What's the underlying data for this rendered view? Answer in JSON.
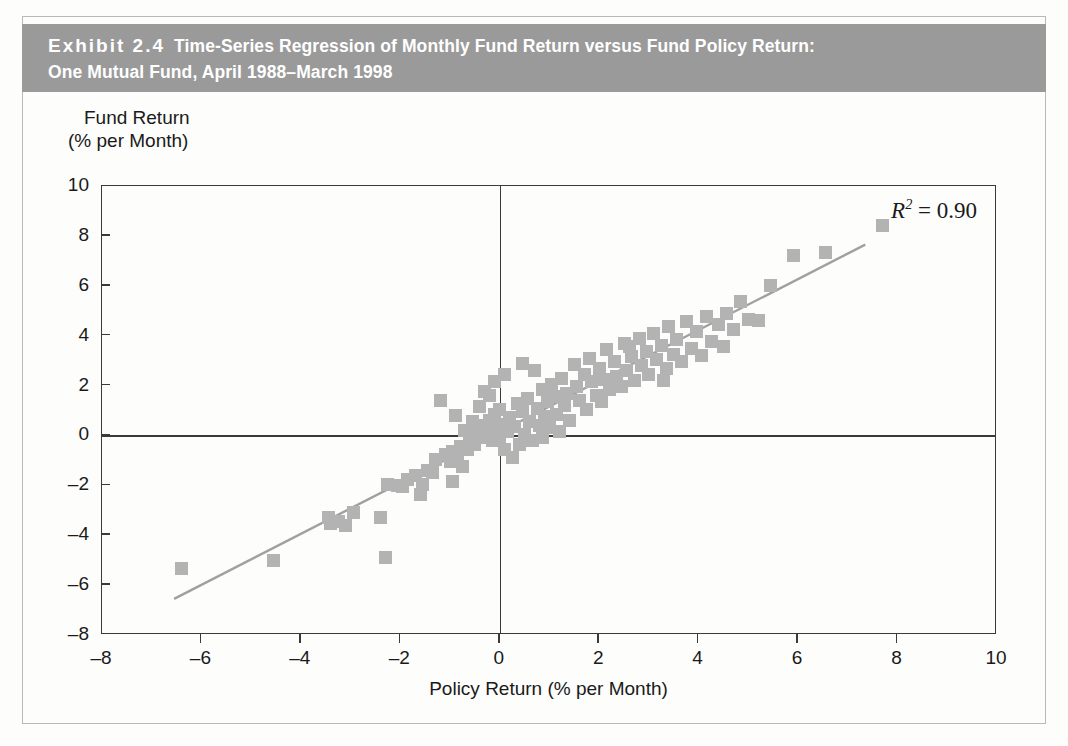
{
  "exhibit": {
    "label": "Exhibit 2.4",
    "title_line_1": "Time-Series Regression of Monthly Fund Return versus Fund Policy Return:",
    "title_line_2": "One Mutual Fund, April 1988–March 1998",
    "banner_color": "#9a9a9a",
    "banner_text_color": "#ffffff"
  },
  "chart_data": {
    "type": "scatter",
    "title": "Time-Series Regression of Monthly Fund Return versus Fund Policy Return: One Mutual Fund, April 1988–March 1998",
    "xlabel": "Policy Return (% per Month)",
    "ylabel_line_1": "Fund Return",
    "ylabel_line_2": "(% per Month)",
    "ylabel": "Fund Return (% per Month)",
    "xlim": [
      -8,
      10
    ],
    "ylim": [
      -8,
      10
    ],
    "xticks": [
      -8,
      -6,
      -4,
      -2,
      0,
      2,
      4,
      6,
      8,
      10
    ],
    "yticks": [
      -8,
      -6,
      -4,
      -2,
      0,
      2,
      4,
      6,
      8,
      10
    ],
    "xticklabels": [
      "–8",
      "–6",
      "–4",
      "–2",
      "0",
      "2",
      "4",
      "6",
      "8",
      "10"
    ],
    "yticklabels": [
      "–8",
      "–6",
      "–4",
      "–2",
      "0",
      "2",
      "4",
      "6",
      "8",
      "10"
    ],
    "grid": false,
    "legend": false,
    "marker_color": "#b3b3b3",
    "marker_shape": "square",
    "annotation": {
      "text": "R2 = 0.90",
      "r_squared": 0.9,
      "position": "top-right"
    },
    "zero_lines": {
      "x": 0,
      "y": 0
    },
    "regression_line": {
      "x_start": -6.55,
      "y_start": -6.55,
      "x_end": 7.35,
      "y_end": 7.65,
      "color": "#a0a0a0",
      "slope": 1.02,
      "intercept": 0.13
    },
    "points": [
      [
        -6.4,
        -5.35
      ],
      [
        -4.55,
        -5.0
      ],
      [
        -3.45,
        -3.3
      ],
      [
        -3.4,
        -3.55
      ],
      [
        -3.25,
        -3.45
      ],
      [
        -3.1,
        -3.6
      ],
      [
        -2.95,
        -3.1
      ],
      [
        -2.4,
        -3.3
      ],
      [
        -2.3,
        -4.9
      ],
      [
        -2.25,
        -1.95
      ],
      [
        -2.05,
        -2.0
      ],
      [
        -1.95,
        -2.05
      ],
      [
        -1.85,
        -1.75
      ],
      [
        -1.7,
        -1.6
      ],
      [
        -1.55,
        -1.95
      ],
      [
        -1.45,
        -1.4
      ],
      [
        -1.35,
        -1.5
      ],
      [
        -1.3,
        -0.95
      ],
      [
        -1.2,
        1.4
      ],
      [
        -1.1,
        -0.75
      ],
      [
        -1.0,
        -1.05
      ],
      [
        -0.95,
        -0.65
      ],
      [
        -0.9,
        0.8
      ],
      [
        -0.85,
        -0.95
      ],
      [
        -0.8,
        -0.45
      ],
      [
        -0.75,
        -1.25
      ],
      [
        -0.7,
        0.2
      ],
      [
        -0.65,
        -0.55
      ],
      [
        -0.6,
        -0.3
      ],
      [
        -0.55,
        0.55
      ],
      [
        -0.5,
        -0.35
      ],
      [
        -0.45,
        0.1
      ],
      [
        -0.4,
        1.15
      ],
      [
        -0.35,
        0.4
      ],
      [
        -0.3,
        -0.1
      ],
      [
        -0.3,
        1.75
      ],
      [
        -0.25,
        0.25
      ],
      [
        -0.2,
        0.6
      ],
      [
        -0.2,
        1.6
      ],
      [
        -0.15,
        -0.2
      ],
      [
        -0.1,
        0.85
      ],
      [
        -0.1,
        2.15
      ],
      [
        -0.05,
        0.3
      ],
      [
        0.0,
        -0.15
      ],
      [
        0.0,
        1.05
      ],
      [
        0.05,
        0.45
      ],
      [
        0.1,
        -0.55
      ],
      [
        0.1,
        2.45
      ],
      [
        0.15,
        0.15
      ],
      [
        0.2,
        0.7
      ],
      [
        0.25,
        -0.9
      ],
      [
        0.3,
        0.35
      ],
      [
        0.35,
        1.3
      ],
      [
        0.4,
        -0.35
      ],
      [
        0.45,
        0.95
      ],
      [
        0.5,
        0.05
      ],
      [
        0.55,
        1.5
      ],
      [
        0.6,
        0.55
      ],
      [
        0.65,
        -0.2
      ],
      [
        0.7,
        2.6
      ],
      [
        0.75,
        1.1
      ],
      [
        0.8,
        0.4
      ],
      [
        0.85,
        1.85
      ],
      [
        0.9,
        0.75
      ],
      [
        0.95,
        1.35
      ],
      [
        1.0,
        0.3
      ],
      [
        1.05,
        2.05
      ],
      [
        1.1,
        1.55
      ],
      [
        1.15,
        0.85
      ],
      [
        1.25,
        2.3
      ],
      [
        1.3,
        1.2
      ],
      [
        1.35,
        1.7
      ],
      [
        1.4,
        0.6
      ],
      [
        1.5,
        2.85
      ],
      [
        1.55,
        1.95
      ],
      [
        1.6,
        1.4
      ],
      [
        1.7,
        2.45
      ],
      [
        1.75,
        1.05
      ],
      [
        1.8,
        3.1
      ],
      [
        1.85,
        2.15
      ],
      [
        1.95,
        1.6
      ],
      [
        2.0,
        2.7
      ],
      [
        2.1,
        2.25
      ],
      [
        2.15,
        3.45
      ],
      [
        2.2,
        1.85
      ],
      [
        2.3,
        2.95
      ],
      [
        2.35,
        2.35
      ],
      [
        2.45,
        1.95
      ],
      [
        2.5,
        3.7
      ],
      [
        2.55,
        2.6
      ],
      [
        2.65,
        3.15
      ],
      [
        2.7,
        2.2
      ],
      [
        2.8,
        3.9
      ],
      [
        2.85,
        2.8
      ],
      [
        2.95,
        3.35
      ],
      [
        3.0,
        2.45
      ],
      [
        3.1,
        4.1
      ],
      [
        3.15,
        3.05
      ],
      [
        3.25,
        3.6
      ],
      [
        3.35,
        2.7
      ],
      [
        3.4,
        4.35
      ],
      [
        3.5,
        3.25
      ],
      [
        3.55,
        3.85
      ],
      [
        3.65,
        2.95
      ],
      [
        3.75,
        4.55
      ],
      [
        3.85,
        3.5
      ],
      [
        3.95,
        4.15
      ],
      [
        4.05,
        3.2
      ],
      [
        4.15,
        4.75
      ],
      [
        4.25,
        3.75
      ],
      [
        4.4,
        4.45
      ],
      [
        4.55,
        4.9
      ],
      [
        4.7,
        4.25
      ],
      [
        4.85,
        5.35
      ],
      [
        5.0,
        4.65
      ],
      [
        5.2,
        4.6
      ],
      [
        5.45,
        6.0
      ],
      [
        5.9,
        7.2
      ],
      [
        6.55,
        7.35
      ],
      [
        7.7,
        8.4
      ],
      [
        1.2,
        0.15
      ],
      [
        0.45,
        2.9
      ],
      [
        2.05,
        1.35
      ],
      [
        3.3,
        2.2
      ],
      [
        4.5,
        3.55
      ],
      [
        -1.6,
        -2.35
      ],
      [
        -0.95,
        -1.85
      ],
      [
        0.85,
        -0.1
      ],
      [
        2.6,
        3.55
      ]
    ]
  }
}
